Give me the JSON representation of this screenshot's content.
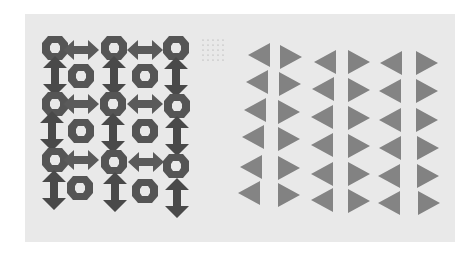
{
  "image": {
    "description": "Black-and-white photograph of an artwork on paper: left panel with a grid of stamped rings and double-headed arrows, right panel with columns of stamped triangles separated by vertical bands",
    "colors": {
      "background": "#ffffff",
      "paper": "#e9e9e9",
      "ink_dark": "#3a3a3a",
      "ink_mid": "#6a6a6a",
      "ink_light": "#9a9a9a"
    },
    "left_panel": {
      "columns": 5,
      "rows": 6,
      "motifs": [
        "ring",
        "horizontal-double-arrow",
        "vertical-double-arrow"
      ]
    },
    "dot_grid": {
      "columns": 5,
      "rows": 5
    },
    "right_panel": {
      "column_pairs": 3,
      "triangles_per_column": 6,
      "motif": "triangle"
    }
  }
}
